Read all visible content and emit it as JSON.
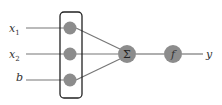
{
  "diagram": {
    "inputs": [
      {
        "label": "x",
        "sub": "1"
      },
      {
        "label": "x",
        "sub": "2"
      },
      {
        "label": "b",
        "sub": ""
      }
    ],
    "sum_symbol": "Σ",
    "activation_symbol": "f",
    "output_label": "y",
    "colors": {
      "node": "#8c8c8c",
      "line": "#777777",
      "box": "#222222"
    }
  }
}
